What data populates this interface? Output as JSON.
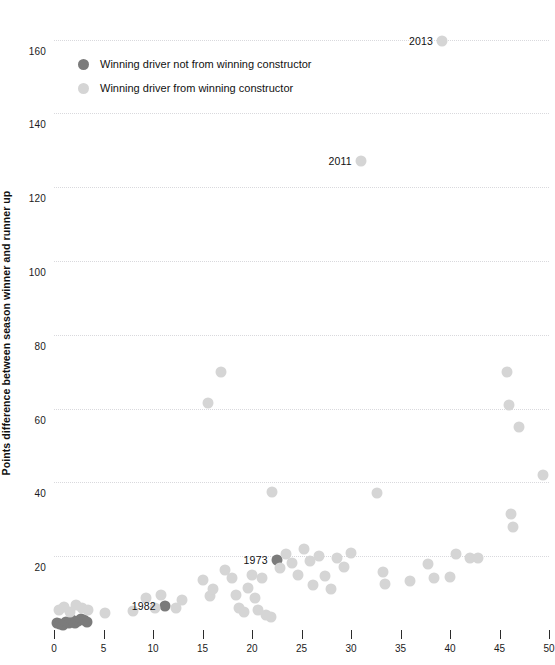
{
  "chart_data": {
    "type": "scatter",
    "title": "",
    "xlabel": "",
    "ylabel": "Points difference between season winner and runner up",
    "xlim": [
      0,
      50
    ],
    "ylim": [
      0,
      168
    ],
    "xticks": [
      0,
      5,
      10,
      15,
      20,
      25,
      30,
      35,
      40,
      45,
      50
    ],
    "yticks": [
      20,
      40,
      60,
      80,
      100,
      120,
      140,
      160
    ],
    "grid": "horizontal-dotted",
    "legend_position": "top-left-inside",
    "series": [
      {
        "name": "Winning driver not from winning constructor",
        "color": "#7b7b7b",
        "points": [
          [
            0.3,
            2.0
          ],
          [
            0.6,
            1.6
          ],
          [
            0.9,
            1.4
          ],
          [
            1.2,
            2.2
          ],
          [
            1.5,
            1.8
          ],
          [
            1.8,
            2.6
          ],
          [
            2.1,
            2.0
          ],
          [
            2.4,
            2.4
          ],
          [
            2.7,
            3.0
          ],
          [
            3.0,
            2.8
          ],
          [
            3.3,
            2.2
          ],
          [
            11.2,
            6.5
          ],
          [
            22.5,
            19.0
          ]
        ]
      },
      {
        "name": "Winning driver from winning constructor",
        "color": "#d5d5d5",
        "points": [
          [
            0.5,
            5.5
          ],
          [
            1.0,
            6.2
          ],
          [
            1.6,
            5.0
          ],
          [
            2.2,
            6.8
          ],
          [
            2.8,
            6.0
          ],
          [
            3.4,
            5.4
          ],
          [
            5.2,
            4.6
          ],
          [
            8.0,
            5.2
          ],
          [
            9.3,
            8.6
          ],
          [
            10.2,
            6.0
          ],
          [
            10.8,
            9.4
          ],
          [
            12.3,
            6.0
          ],
          [
            12.9,
            8.2
          ],
          [
            15.0,
            13.6
          ],
          [
            15.6,
            61.5
          ],
          [
            15.8,
            9.2
          ],
          [
            16.1,
            11.0
          ],
          [
            16.9,
            70.0
          ],
          [
            17.3,
            16.2
          ],
          [
            18.0,
            14.2
          ],
          [
            18.4,
            9.6
          ],
          [
            18.7,
            6.0
          ],
          [
            19.2,
            4.8
          ],
          [
            19.6,
            11.4
          ],
          [
            20.0,
            14.8
          ],
          [
            20.3,
            8.6
          ],
          [
            20.6,
            5.4
          ],
          [
            21.0,
            14.0
          ],
          [
            21.4,
            4.2
          ],
          [
            21.9,
            3.6
          ],
          [
            22.0,
            37.5
          ],
          [
            22.8,
            16.8
          ],
          [
            23.4,
            20.6
          ],
          [
            24.0,
            18.2
          ],
          [
            24.6,
            15.0
          ],
          [
            25.3,
            22.0
          ],
          [
            25.9,
            18.6
          ],
          [
            26.2,
            12.2
          ],
          [
            26.8,
            20.0
          ],
          [
            27.4,
            14.6
          ],
          [
            28.0,
            11.0
          ],
          [
            28.6,
            19.4
          ],
          [
            29.3,
            17.2
          ],
          [
            30.0,
            21.0
          ],
          [
            31.0,
            127.0
          ],
          [
            32.6,
            37.0
          ],
          [
            33.2,
            15.8
          ],
          [
            33.4,
            12.6
          ],
          [
            36.0,
            13.2
          ],
          [
            37.8,
            18.0
          ],
          [
            38.4,
            14.2
          ],
          [
            39.2,
            159.5
          ],
          [
            40.0,
            14.4
          ],
          [
            40.6,
            20.6
          ],
          [
            42.0,
            19.6
          ],
          [
            42.8,
            19.4
          ],
          [
            45.8,
            70.0
          ],
          [
            46.0,
            61.0
          ],
          [
            46.2,
            31.5
          ],
          [
            46.4,
            27.8
          ],
          [
            47.0,
            55.0
          ],
          [
            49.4,
            42.0
          ]
        ]
      }
    ],
    "annotations": [
      {
        "label": "2013",
        "x": 39.2,
        "y": 159.5
      },
      {
        "label": "2011",
        "x": 31.0,
        "y": 127.0
      },
      {
        "label": "1973",
        "x": 22.5,
        "y": 19.0
      },
      {
        "label": "1982",
        "x": 11.2,
        "y": 6.5
      }
    ]
  },
  "axes": {
    "y_title": "Points difference between season winner and runner up",
    "y_tick_labels": [
      "160",
      "140",
      "120",
      "100",
      "80",
      "60",
      "40",
      "20"
    ],
    "x_tick_labels": [
      "0",
      "5",
      "10",
      "15",
      "20",
      "25",
      "30",
      "35",
      "40",
      "45",
      "50"
    ]
  },
  "legend": {
    "items": [
      {
        "label": "Winning driver not from winning constructor",
        "swatch": "dark"
      },
      {
        "label": "Winning driver from winning constructor",
        "swatch": "light"
      }
    ]
  },
  "clipped_title": ""
}
